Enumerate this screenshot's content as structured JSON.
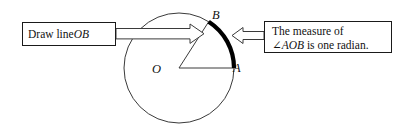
{
  "figure": {
    "name": "one-radian-circle-diagram",
    "background_color": "#ffffff",
    "line_color": "#3a3a3a",
    "arc_color": "#000000",
    "text_color": "#111111"
  },
  "callouts": {
    "left": {
      "name": "draw-line-ob-callout",
      "text_plain": "Draw line OB",
      "lead": "Draw line ",
      "emphasis": "OB",
      "box": {
        "x": 22,
        "y": 22,
        "width": 94,
        "height": 24
      }
    },
    "right": {
      "name": "measure-of-angle-callout",
      "text_plain": "The measure of ∠AOB is one radian.",
      "line1": "The measure of",
      "line2_angle_symbol": "∠",
      "line2_emphasis": "AOB",
      "line2_tail": " is one radian.",
      "box": {
        "x": 264,
        "y": 21,
        "width": 128,
        "height": 32
      }
    }
  },
  "circle": {
    "name": "main-circle",
    "center": {
      "x": 179,
      "y": 68
    },
    "radius": 55,
    "stroke_width": 1
  },
  "points": [
    {
      "name": "point-O",
      "label": "O",
      "x": 179,
      "y": 68,
      "role": "center"
    },
    {
      "name": "point-A",
      "label": "A",
      "x": 234,
      "y": 68,
      "role": "arc-start",
      "angle_deg": 0
    },
    {
      "name": "point-B",
      "label": "B",
      "x": 209,
      "y": 22,
      "role": "arc-end",
      "angle_deg": 57.3
    }
  ],
  "radii": [
    {
      "name": "radius-OA",
      "from": "O",
      "to": "A"
    },
    {
      "name": "radius-OB",
      "from": "O",
      "to": "B"
    }
  ],
  "arc": {
    "name": "radian-arc-AB",
    "from": "A",
    "to": "B",
    "sweep_deg": 57.3,
    "stroke_width": 4,
    "color": "#000000",
    "meaning": "arc length equals radius"
  },
  "arrows": [
    {
      "name": "left-block-arrow",
      "direction": "right",
      "style": "hollow-outline",
      "from_callout": "left",
      "points_to": "radius-OB"
    },
    {
      "name": "right-block-arrow",
      "direction": "left",
      "style": "hollow-outline",
      "from_callout": "right",
      "points_to": "radian-arc-AB"
    }
  ]
}
